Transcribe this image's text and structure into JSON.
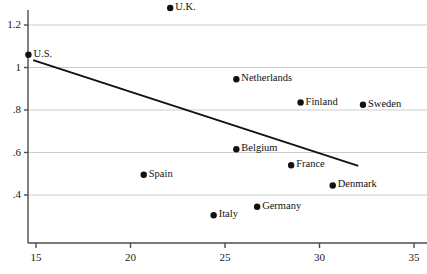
{
  "chart_data": {
    "type": "scatter",
    "title": "",
    "xlabel": "",
    "ylabel": "",
    "xlim": [
      13.9,
      35.8
    ],
    "ylim": [
      0.31,
      1.33
    ],
    "xticks": [
      15,
      20,
      25,
      30,
      35
    ],
    "xtick_labels": [
      "15",
      "20",
      "25",
      "30",
      "35"
    ],
    "yticks": [
      0.4,
      0.6,
      0.8,
      1.0,
      1.2
    ],
    "ytick_labels": [
      ".4",
      ".6",
      ".8",
      "1",
      "1.2"
    ],
    "grid": "horizontal",
    "legend": "none",
    "points": [
      {
        "label": "U.K.",
        "x": 22.1,
        "y": 1.28,
        "label_side": "right"
      },
      {
        "label": "U.S.",
        "x": 14.6,
        "y": 1.06,
        "label_side": "right"
      },
      {
        "label": "Netherlands",
        "x": 25.6,
        "y": 0.945,
        "label_side": "right"
      },
      {
        "label": "Finland",
        "x": 29.0,
        "y": 0.835,
        "label_side": "right"
      },
      {
        "label": "Sweden",
        "x": 32.3,
        "y": 0.825,
        "label_side": "right"
      },
      {
        "label": "Belgium",
        "x": 25.6,
        "y": 0.615,
        "label_side": "right"
      },
      {
        "label": "France",
        "x": 28.5,
        "y": 0.54,
        "label_side": "right"
      },
      {
        "label": "Spain",
        "x": 20.7,
        "y": 0.495,
        "label_side": "right"
      },
      {
        "label": "Denmark",
        "x": 30.7,
        "y": 0.445,
        "label_side": "right"
      },
      {
        "label": "Germany",
        "x": 26.7,
        "y": 0.345,
        "label_side": "right"
      },
      {
        "label": "Italy",
        "x": 24.4,
        "y": 0.305,
        "label_side": "right"
      }
    ],
    "trend_line": {
      "x0": 14.85,
      "y0": 1.035,
      "x1": 32.05,
      "y1": 0.5375
    }
  },
  "colors": {
    "axis": "#4d4d4d",
    "grid": "#cccccc",
    "marker": "#111111",
    "line": "#111111",
    "text": "#1a1a1a",
    "background": "#ffffff"
  }
}
